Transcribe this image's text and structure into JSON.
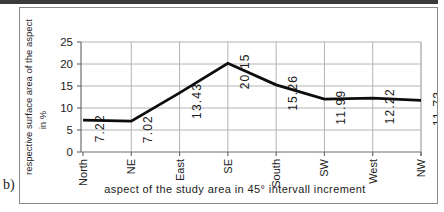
{
  "figure_label": "b)",
  "chart_data": {
    "type": "line",
    "categories": [
      "North",
      "NE",
      "East",
      "SE",
      "South",
      "SW",
      "West",
      "NW"
    ],
    "values": [
      7.22,
      7.02,
      13.43,
      20.15,
      15.26,
      11.99,
      12.22,
      11.73
    ],
    "point_labels": [
      "7.22",
      "7.02",
      "13.43",
      "20.15",
      "15.26",
      "11.99",
      "12.22",
      "11.73"
    ],
    "title": "",
    "xlabel": "aspect of the study area in 45° intervall increment",
    "ylabel": "respective surface area of the aspect",
    "ylabel_unit": "in %",
    "ylim": [
      0,
      25
    ],
    "yticks": [
      0,
      5,
      10,
      15,
      20,
      25
    ],
    "grid": true,
    "legend": false,
    "label_rotation_deg": -90,
    "colors": {
      "line": "#0d0d0d",
      "grid": "#b4b4b4",
      "axis": "#6e6e6e",
      "text": "#1c1c1c",
      "frame_border": "#8a8a8a",
      "top_bar": "#3a3a3a",
      "background": "#ffffff"
    }
  }
}
